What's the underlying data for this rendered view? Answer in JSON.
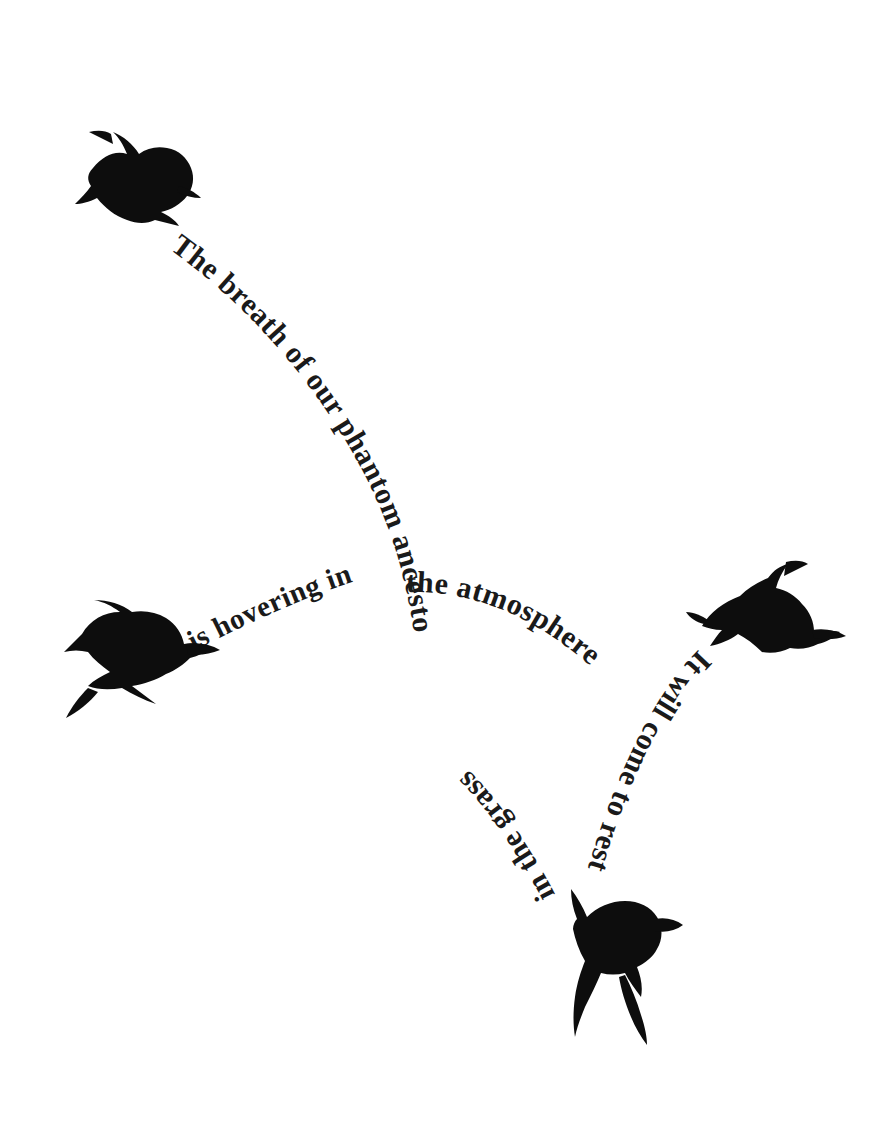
{
  "artwork": {
    "title": "The breath of our phantom ancestors",
    "background_color": "#ffffff",
    "ink_color": "#0d0d0d",
    "text_color": "#1a1a1a",
    "width": 873,
    "height": 1136
  },
  "poem": {
    "full_text": "The breath of our phantom ancestors is hovering in the atmosphere It will come to rest in the grass",
    "lines": [
      {
        "id": "line-1",
        "text": "The breath of our phantom ancestors",
        "path": "arc descending from upper left to center",
        "font_size": 30
      },
      {
        "id": "line-2",
        "text": "is hovering in",
        "path": "arc rising from left bird toward center",
        "font_size": 29
      },
      {
        "id": "line-3",
        "text": "the atmosphere",
        "path": "arc descending to the right of center",
        "font_size": 30
      },
      {
        "id": "line-4",
        "text": "It will come to rest",
        "path": "arc descending from right bird, letters inverted",
        "font_size": 30
      },
      {
        "id": "line-5",
        "text": "in the grass",
        "path": "arc rising from bottom bird, letters inverted",
        "font_size": 30
      }
    ]
  },
  "birds": [
    {
      "id": "bird-top-left",
      "label": "crow-diving",
      "x": 75,
      "y": 130,
      "description": "black crow silhouette in a dive, head toward lower right"
    },
    {
      "id": "bird-mid-left",
      "label": "crow-flying",
      "x": 60,
      "y": 600,
      "description": "black crow silhouette with spread wings flying right"
    },
    {
      "id": "bird-mid-right",
      "label": "crow-gliding",
      "x": 690,
      "y": 560,
      "description": "black crow silhouette gliding with angled wings"
    },
    {
      "id": "bird-bottom",
      "label": "crow-landing",
      "x": 545,
      "y": 885,
      "description": "black crow silhouette alighting with raised wings"
    }
  ]
}
